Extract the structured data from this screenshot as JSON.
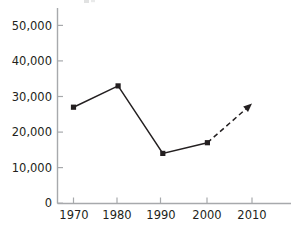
{
  "chart_data": {
    "type": "line",
    "title": "",
    "subtitle": "",
    "xlabel": "",
    "ylabel": "",
    "x": [
      1970,
      1980,
      1990,
      2000,
      2010
    ],
    "categories": [
      "1970",
      "1980",
      "1990",
      "2000",
      "2010"
    ],
    "values": [
      27000,
      33000,
      14000,
      17000,
      28000
    ],
    "series": [
      {
        "name": "Actual",
        "style": "solid",
        "x": [
          1970,
          1980,
          1990,
          2000
        ],
        "values": [
          27000,
          33000,
          14000,
          17000
        ]
      },
      {
        "name": "Projected",
        "style": "dashed",
        "arrow_end": true,
        "x": [
          2000,
          2010
        ],
        "values": [
          17000,
          28000
        ]
      }
    ],
    "ylim": [
      0,
      50000
    ],
    "xlim": [
      1965,
      2015
    ],
    "ytick_values": [
      0,
      10000,
      20000,
      30000,
      40000,
      50000
    ],
    "ytick_labels": [
      "0",
      "10,000",
      "20,000",
      "30,000",
      "40,000",
      "50,000"
    ],
    "xtick_values": [
      1970,
      1980,
      1990,
      2000,
      2010
    ],
    "xtick_labels": [
      "1970",
      "1980",
      "1990",
      "2000",
      "2010"
    ],
    "grid": false,
    "legend": "none",
    "marker": "square",
    "colors": {
      "line": "#231f20",
      "marker": "#231f20",
      "axis": "#a7a9ac",
      "tick_text": "#231f20",
      "background": "#ffffff"
    }
  }
}
